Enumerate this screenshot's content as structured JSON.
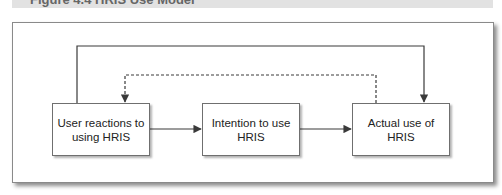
{
  "caption": {
    "text": "Figure 4.4  HRIS Use Model"
  },
  "diagram": {
    "nodes": [
      {
        "id": "user-reactions",
        "label": "User reactions to using HRIS"
      },
      {
        "id": "intention",
        "label": "Intention to use HRIS"
      },
      {
        "id": "actual-use",
        "label": "Actual use of HRIS"
      }
    ],
    "edges": [
      {
        "from": "user-reactions",
        "to": "intention",
        "style": "solid"
      },
      {
        "from": "intention",
        "to": "actual-use",
        "style": "solid"
      },
      {
        "from": "user-reactions",
        "to": "actual-use",
        "style": "solid",
        "route": "over-top"
      },
      {
        "from": "actual-use",
        "to": "user-reactions",
        "style": "dashed",
        "route": "over-top",
        "label": "feedback"
      }
    ],
    "colors": {
      "line": "#3a3a3a",
      "box_border": "#6f6f6f",
      "caption_bar": "#e2e2e2"
    }
  }
}
